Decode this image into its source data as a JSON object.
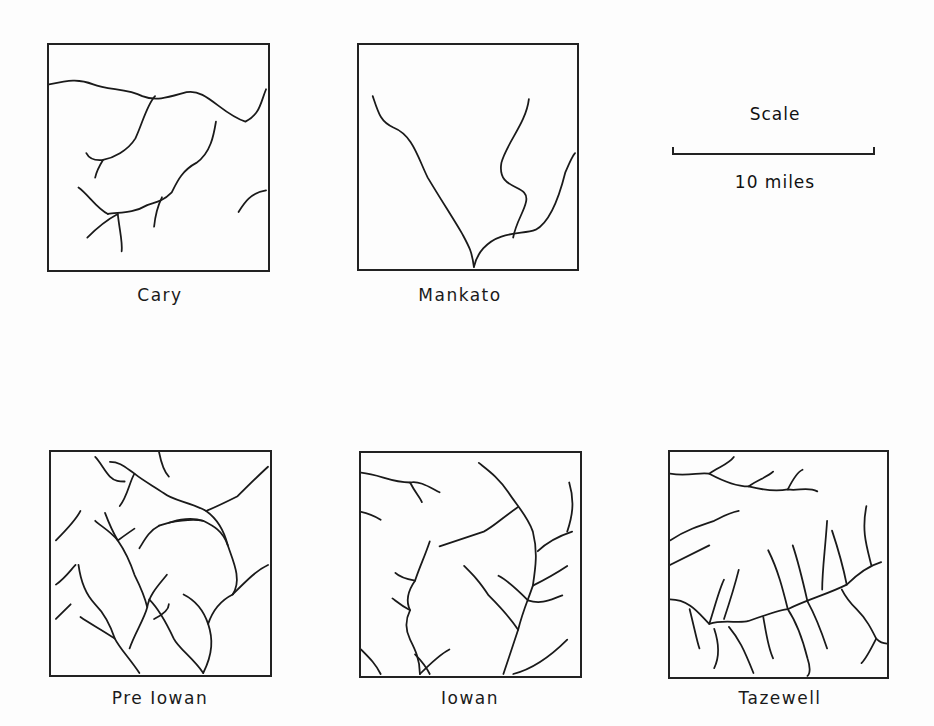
{
  "figure": {
    "panels": [
      {
        "id": "cary",
        "label": "Cary",
        "pattern": "sparse, poorly integrated drainage"
      },
      {
        "id": "mankato",
        "label": "Mankato",
        "pattern": "very sparse drainage, few streams"
      },
      {
        "id": "pre_iowan",
        "label": "Pre Iowan",
        "pattern": "dense dendritic drainage"
      },
      {
        "id": "iowan",
        "label": "Iowan",
        "pattern": "well-developed dendritic drainage"
      },
      {
        "id": "tazewell",
        "label": "Tazewell",
        "pattern": "moderately developed dendritic drainage"
      }
    ],
    "scale": {
      "title": "Scale",
      "label": "10 miles"
    }
  },
  "colors": {
    "line": "#1a1a1a",
    "background": "#fdfdfd"
  }
}
